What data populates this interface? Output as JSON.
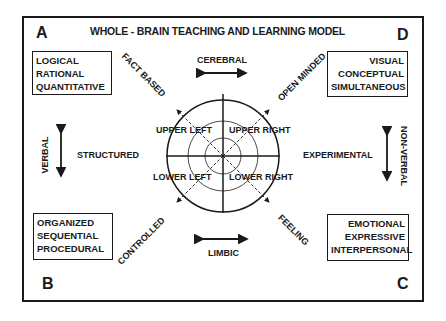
{
  "title": "WHOLE - BRAIN TEACHING AND LEARNING MODEL",
  "corners": {
    "top_left": "A",
    "top_right": "D",
    "bottom_left": "B",
    "bottom_right": "C"
  },
  "boxes": {
    "a": [
      "LOGICAL",
      "RATIONAL",
      "QUANTITATIVE"
    ],
    "d": [
      "VISUAL",
      "CONCEPTUAL",
      "SIMULTANEOUS"
    ],
    "b": [
      "ORGANIZED",
      "SEQUENTIAL",
      "PROCEDURAL"
    ],
    "c": [
      "EMOTIONAL",
      "EXPRESSIVE",
      "INTERPERSONAL"
    ]
  },
  "diagonals": {
    "upper_left": "FACT BASED",
    "upper_right": "OPEN MINDED",
    "lower_left": "CONTROLLED",
    "lower_right": "FEELING"
  },
  "axes": {
    "top": "CEREBRAL",
    "bottom": "LIMBIC",
    "left_vertical": "VERBAL",
    "left_inner": "STRUCTURED",
    "right_vertical": "NON-VERBAL",
    "right_inner": "EXPERIMENTAL"
  },
  "quadrants": {
    "upper_left": "UPPER LEFT",
    "upper_right": "UPPER RIGHT",
    "lower_left": "LOWER LEFT",
    "lower_right": "LOWER RIGHT"
  },
  "colors": {
    "ink": "#1a1a1a",
    "background": "#ffffff"
  }
}
